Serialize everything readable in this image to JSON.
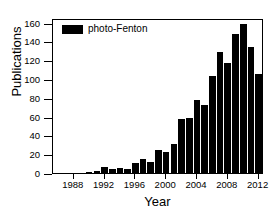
{
  "chart_data": {
    "type": "bar",
    "title": "",
    "xlabel": "Year",
    "ylabel": "Publications",
    "legend": [
      {
        "name": "photo-Fenton",
        "color": "#000000",
        "swatch": "filled-rectangle"
      }
    ],
    "legend_position": "top-left-inside",
    "grid": false,
    "bar_color": "#000000",
    "axis_color": "#000000",
    "background_color": "#ffffff",
    "xlim": [
      1985.3,
      2012.7
    ],
    "ylim": [
      0,
      165
    ],
    "ytick_values": [
      0,
      20,
      40,
      60,
      80,
      100,
      120,
      140,
      160
    ],
    "ytick_labels": [
      "0",
      "20",
      "40",
      "60",
      "80",
      "100",
      "120",
      "140",
      "160"
    ],
    "xtick_values": [
      1988,
      1992,
      1996,
      2000,
      2004,
      2008,
      2012
    ],
    "xtick_labels": [
      "1988",
      "1992",
      "1996",
      "2000",
      "2004",
      "2008",
      "2012"
    ],
    "categories": [
      1986,
      1987,
      1988,
      1989,
      1990,
      1991,
      1992,
      1993,
      1994,
      1995,
      1996,
      1997,
      1998,
      1999,
      2000,
      2001,
      2002,
      2003,
      2004,
      2005,
      2006,
      2007,
      2008,
      2009,
      2010,
      2011,
      2012
    ],
    "series": [
      {
        "name": "photo-Fenton",
        "values": [
          0,
          0,
          0,
          0,
          1,
          2,
          6,
          4,
          5,
          4,
          11,
          15,
          12,
          24,
          22,
          31,
          58,
          59,
          78,
          72,
          103,
          129,
          117,
          148,
          159,
          134,
          105
        ]
      }
    ]
  }
}
